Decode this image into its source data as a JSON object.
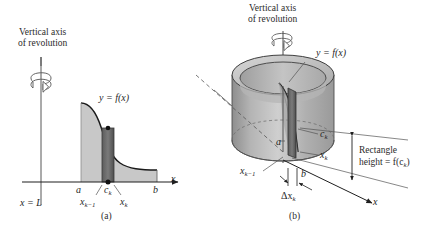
{
  "figure": {
    "background_color": "#ffffff",
    "ink_color": "#1f1f1f",
    "region_fill": "#c8c8c8",
    "slab_fill": "#6e6e6e",
    "cylinder_fill": "#b9b9b9"
  },
  "panel_a": {
    "caption": "(a)",
    "axis_note_line1": "Vertical axis",
    "axis_note_line2": "of revolution",
    "curve_label": "y = f(x)",
    "axis_line_label": "x = L",
    "x_axis_label": "x",
    "tick_a": "a",
    "tick_b": "b",
    "tick_ck": "c",
    "tick_ck_sub": "k",
    "tick_xk_minus_1": "x",
    "tick_xk_minus_1_sub": "k−1",
    "tick_xk": "x",
    "tick_xk_sub": "k"
  },
  "panel_b": {
    "caption": "(b)",
    "axis_note_line1": "Vertical axis",
    "axis_note_line2": "of revolution",
    "curve_label": "y = f(x)",
    "x_axis_label": "x",
    "tick_a": "a",
    "tick_b": "b",
    "tick_ck": "c",
    "tick_ck_sub": "k",
    "tick_xk_minus_1": "x",
    "tick_xk_minus_1_sub": "k−1",
    "tick_xk": "x",
    "tick_xk_sub": "k",
    "delta_label": "Δx",
    "delta_label_sub": "k",
    "height_line1": "Rectangle",
    "height_line2_prefix": "height = f(c",
    "height_line2_sub": "k",
    "height_line2_suffix": ")"
  }
}
